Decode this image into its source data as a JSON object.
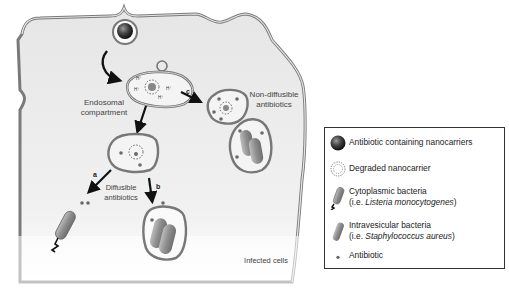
{
  "diagram": {
    "labels": {
      "endosomal": [
        "Endosomal",
        "compartment"
      ],
      "non_diffusible": [
        "Non-diffusible",
        "antibiotics"
      ],
      "diffusible": [
        "Diffusible",
        "antibiotics"
      ],
      "infected_cells": "Infected cells",
      "proton": "H+"
    },
    "pathways": {
      "a": "a",
      "b": "b",
      "c": "c"
    }
  },
  "legend": {
    "items": [
      {
        "icon": "nanocarrier-sphere-icon",
        "line1": "Antibiotic containing nanocarriers"
      },
      {
        "icon": "degraded-nanocarrier-icon",
        "line1": "Degraded nanocarrier"
      },
      {
        "icon": "cytoplasmic-bacteria-icon",
        "line1": "Cytoplasmic bacteria",
        "line2_prefix": "(i.e. ",
        "line2_italic": "Listeria monocytogenes",
        "line2_suffix": ")"
      },
      {
        "icon": "intravesicular-bacteria-icon",
        "line1": "Intravesicular bacteria",
        "line2_prefix": "(i.e. ",
        "line2_italic": "Staphylococcus aureus",
        "line2_suffix": ")"
      },
      {
        "icon": "antibiotic-dot-icon",
        "line1": "Antibiotic"
      }
    ]
  },
  "colors": {
    "cell_fill": "#ebebeb",
    "membrane": "#777777",
    "arrow": "#111111",
    "bacteria": "#9a9a9a",
    "dot": "#6a6a6a"
  }
}
